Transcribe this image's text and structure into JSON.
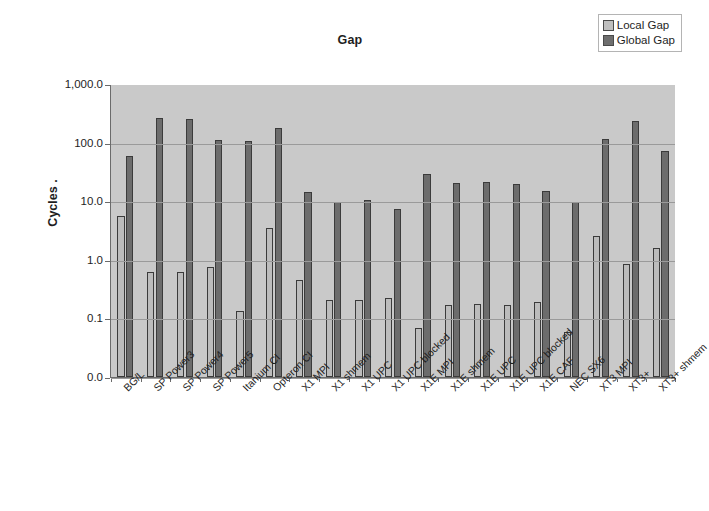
{
  "chart_data": {
    "type": "bar",
    "title": "Gap",
    "xlabel": "",
    "ylabel": "Cycles  .",
    "yscale": "log",
    "ylim": [
      0.0,
      1000.0
    ],
    "ytick_labels": [
      "1,000.0",
      "100.0",
      "10.0",
      "1.0",
      "0.1",
      "0.0"
    ],
    "ytick_values": [
      1000.0,
      100.0,
      10.0,
      1.0,
      0.1,
      0.0
    ],
    "grid": true,
    "legend_position": "top-right",
    "plot_background": "#c9c9c9",
    "categories": [
      "BG/L",
      "SP Power3",
      "SP Power4",
      "SP Power5",
      "Itanium CI",
      "Opteron CI",
      "X1 MPI",
      "X1 shmem",
      "X1 UPC",
      "X1 UPC blocked",
      "X1E MPI",
      "X1E shmem",
      "X1E UPC",
      "X1E UPC blocked",
      "X1E CAF",
      "NEC SX6",
      "XT3 MPI",
      "XT3+",
      "XT3+ shmem"
    ],
    "series": [
      {
        "name": "Local Gap",
        "color": "#bcbcbc",
        "values": [
          5.5,
          0.6,
          0.62,
          0.75,
          0.13,
          3.5,
          0.44,
          0.2,
          0.2,
          0.22,
          0.068,
          0.17,
          0.175,
          0.17,
          0.185,
          0.058,
          2.5,
          0.85,
          1.6
        ]
      },
      {
        "name": "Global Gap",
        "color": "#6c6c6c",
        "values": [
          58,
          260,
          250,
          110,
          105,
          175,
          14,
          9.5,
          10.5,
          7.3,
          29,
          20,
          21.5,
          19.5,
          15,
          9.8,
          115,
          235,
          72
        ]
      }
    ]
  },
  "legend": {
    "items": [
      {
        "label": "Local Gap",
        "swatch": "local"
      },
      {
        "label": "Global Gap",
        "swatch": "global"
      }
    ]
  }
}
